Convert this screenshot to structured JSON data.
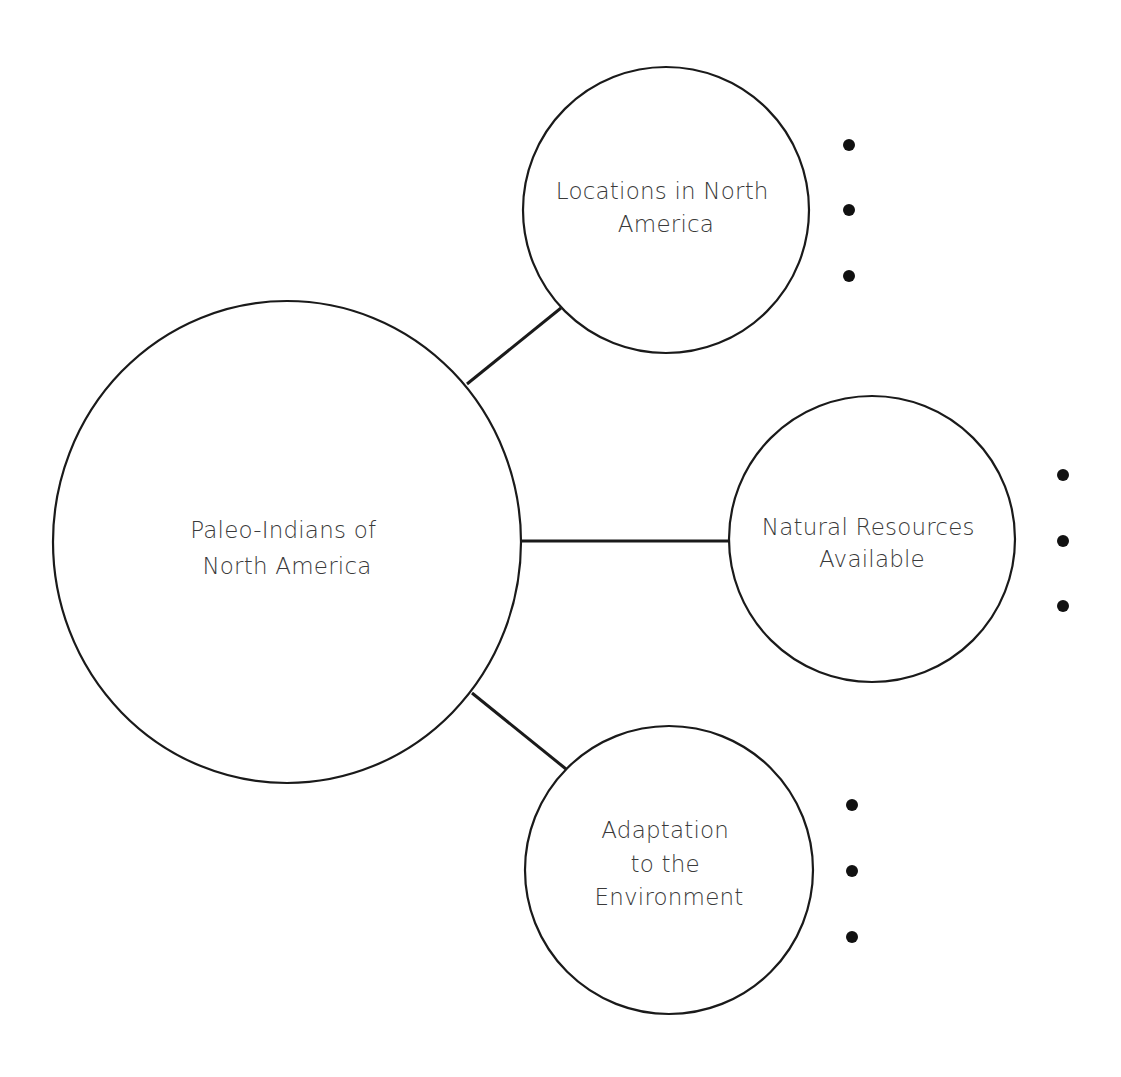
{
  "diagram": {
    "type": "concept-map",
    "central_node": {
      "id": "central",
      "label_lines": [
        "Paleo-Indians of",
        "North America"
      ]
    },
    "branches": [
      {
        "id": "locations",
        "label_lines": [
          "Locations in North",
          "America"
        ],
        "bullets": [
          "",
          "",
          ""
        ]
      },
      {
        "id": "resources",
        "label_lines": [
          "Natural Resources",
          "Available"
        ],
        "bullets": [
          "",
          "",
          ""
        ]
      },
      {
        "id": "adaptation",
        "label_lines": [
          "Adaptation",
          "to the",
          "Environment"
        ],
        "bullets": [
          "",
          "",
          ""
        ]
      }
    ],
    "colors": {
      "stroke": "#1a1a1a",
      "text": "#3a3a3a",
      "bullet": "#111111",
      "background": "#ffffff"
    }
  }
}
